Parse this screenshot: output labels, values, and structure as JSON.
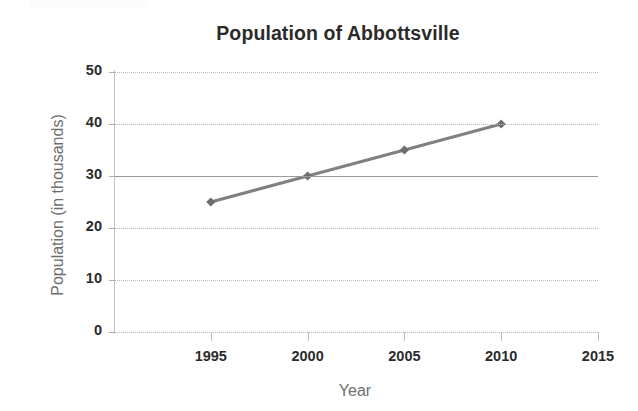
{
  "chart_data": {
    "type": "line",
    "title": "Population of Abbottsville",
    "xlabel": "Year",
    "ylabel": "Population (in thousands)",
    "x": [
      1995,
      2000,
      2005,
      2010
    ],
    "values": [
      25,
      30,
      35,
      40
    ],
    "series": [
      {
        "name": "Population",
        "x": [
          1995,
          2000,
          2005,
          2010
        ],
        "values": [
          25,
          30,
          35,
          40
        ]
      }
    ],
    "xlim": [
      1990,
      2015
    ],
    "ylim": [
      0,
      50
    ],
    "x_ticks": [
      "1995",
      "2000",
      "2005",
      "2010",
      "2015"
    ],
    "x_tick_values": [
      1995,
      2000,
      2005,
      2010,
      2015
    ],
    "y_ticks": [
      "0",
      "10",
      "20",
      "30",
      "40",
      "50"
    ],
    "y_tick_values": [
      0,
      10,
      20,
      30,
      40,
      50
    ],
    "grid": "horizontal-dotted",
    "legend": null,
    "marker": "diamond",
    "colors": {
      "line": "#808080",
      "marker": "#6e6e6e",
      "title_text": "#2b2b2b",
      "tick_text": "#2b2b2b",
      "axis_title_text": "#6e6e6e",
      "gridline": "#b9b9b9",
      "gridline_emphasis": "#9a9a9a",
      "background": "#ffffff"
    }
  }
}
